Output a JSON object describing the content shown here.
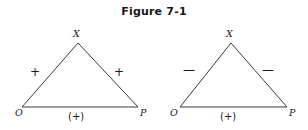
{
  "figure": {
    "caption": "Figure 7-1",
    "background_color": "#ffffff",
    "line_color": "#3a3a3a",
    "text_color": "#171717"
  },
  "diagrams": [
    {
      "id": "left-triangle",
      "apex_label": "X",
      "left_vertex_label": "O",
      "right_vertex_label": "P",
      "left_edge_sign": "+",
      "right_edge_sign": "+",
      "base_sign": "(+)",
      "geometry": {
        "apex_x": 78,
        "apex_y": 43,
        "left_x": 22,
        "left_y": 107,
        "right_x": 138,
        "right_y": 107
      },
      "labels_pos": {
        "apex_label_x": 73,
        "apex_label_y": 29,
        "left_vertex_label_x": 15,
        "left_vertex_label_y": 108,
        "right_vertex_label_x": 140,
        "right_vertex_label_y": 108,
        "left_edge_sign_x": 30,
        "left_edge_sign_y": 66,
        "right_edge_sign_x": 114,
        "right_edge_sign_y": 66,
        "base_sign_x": 68,
        "base_sign_y": 112
      }
    },
    {
      "id": "right-triangle",
      "apex_label": "X",
      "left_vertex_label": "O",
      "right_vertex_label": "P",
      "left_edge_sign": "—",
      "right_edge_sign": "—",
      "base_sign": "(+)",
      "geometry": {
        "apex_x": 231,
        "apex_y": 43,
        "left_x": 180,
        "left_y": 107,
        "right_x": 287,
        "right_y": 107
      },
      "labels_pos": {
        "apex_label_x": 226,
        "apex_label_y": 29,
        "left_vertex_label_x": 170,
        "left_vertex_label_y": 108,
        "right_vertex_label_x": 289,
        "right_vertex_label_y": 108,
        "left_edge_sign_x": 183,
        "left_edge_sign_y": 64,
        "right_edge_sign_x": 262,
        "right_edge_sign_y": 64,
        "base_sign_x": 220,
        "base_sign_y": 112
      }
    }
  ]
}
